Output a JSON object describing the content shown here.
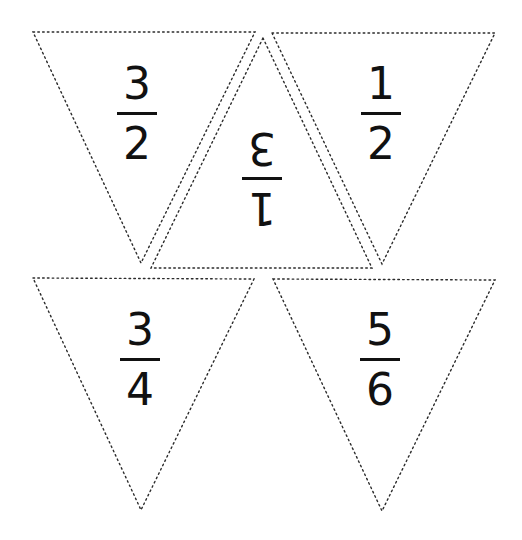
{
  "worksheet": {
    "title": "",
    "outline_style": "dotted",
    "outline_color": "#2b2b2b",
    "text_color": "#111111",
    "pennants": [
      {
        "id": "top-left",
        "orientation": "point-down",
        "numerator": "3",
        "denominator": "2",
        "rotated": false
      },
      {
        "id": "top-middle",
        "orientation": "point-up",
        "numerator": "3",
        "denominator": "1",
        "rotated": true
      },
      {
        "id": "top-right",
        "orientation": "point-down",
        "numerator": "1",
        "denominator": "2",
        "rotated": false
      },
      {
        "id": "bottom-left",
        "orientation": "point-down",
        "numerator": "3",
        "denominator": "4",
        "rotated": false
      },
      {
        "id": "bottom-right",
        "orientation": "point-down",
        "numerator": "5",
        "denominator": "6",
        "rotated": false
      }
    ]
  }
}
